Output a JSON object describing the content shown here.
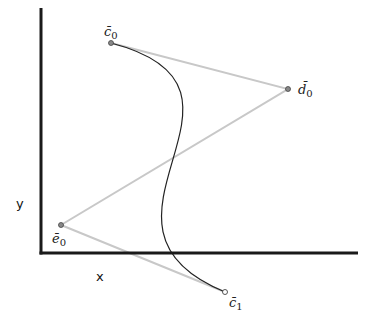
{
  "diagram": {
    "type": "bezier-control-polygon",
    "axes": {
      "x_label": "x",
      "y_label": "y",
      "origin": [
        41,
        253
      ],
      "x_end": [
        358,
        253
      ],
      "y_end": [
        41,
        8
      ],
      "color": "#1a1a1a"
    },
    "control_points": [
      {
        "id": "c0",
        "label": "c̄",
        "sub": "0",
        "pos": [
          111,
          43
        ],
        "label_pos": [
          104,
          36
        ]
      },
      {
        "id": "d0",
        "label": "d̄",
        "sub": "0",
        "pos": [
          288,
          89
        ],
        "label_pos": [
          298,
          94
        ]
      },
      {
        "id": "e0",
        "label": "ē",
        "sub": "0",
        "pos": [
          61,
          225
        ],
        "label_pos": [
          52,
          243
        ]
      },
      {
        "id": "c1",
        "label": "c̄",
        "sub": "1",
        "pos": [
          225,
          292
        ],
        "label_pos": [
          229,
          307
        ]
      }
    ],
    "polygon_color": "#c8c8c8",
    "curve_color": "#222222"
  }
}
